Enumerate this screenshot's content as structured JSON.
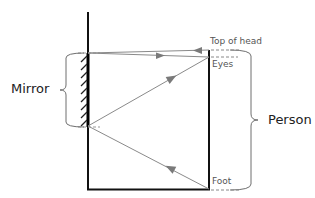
{
  "diagram": {
    "type": "ray-diagram",
    "labels": {
      "mirror": "Mirror",
      "person": "Person",
      "top_of_head": "Top of head",
      "eyes": "Eyes",
      "foot": "Foot"
    },
    "colors": {
      "structure": "#111111",
      "rays": "#8a8a8a",
      "brace": "#6e6e6e",
      "dashed": "#888888"
    },
    "geometry": {
      "mirror_x": 88,
      "person_x": 209,
      "floor_y": 189,
      "wall_top_y": 12,
      "top_of_head_y": 50,
      "eyes_y": 57,
      "mirror_top_y": 53,
      "mirror_bottom_y": 126
    }
  }
}
